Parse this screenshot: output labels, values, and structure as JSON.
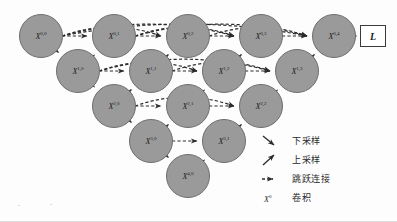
{
  "figure": {
    "node_fill": "#9a9a9a",
    "node_stroke": "#6e6e6e",
    "arrow_color": "#2b2b2b",
    "background": "#fdfdfd"
  },
  "nodes": [
    {
      "id": "x00",
      "label": "X",
      "sup": "0,0",
      "cx": 41,
      "cy": 36,
      "r": 22
    },
    {
      "id": "x01",
      "label": "X",
      "sup": "0,1",
      "cx": 114,
      "cy": 36,
      "r": 22
    },
    {
      "id": "x02",
      "label": "X",
      "sup": "0,2",
      "cx": 188,
      "cy": 36,
      "r": 22
    },
    {
      "id": "x03",
      "label": "X",
      "sup": "0,3",
      "cx": 261,
      "cy": 36,
      "r": 22
    },
    {
      "id": "x04",
      "label": "X",
      "sup": "0,4",
      "cx": 334,
      "cy": 36,
      "r": 22
    },
    {
      "id": "x10",
      "label": "X",
      "sup": "1,0",
      "cx": 78,
      "cy": 71,
      "r": 22
    },
    {
      "id": "x11",
      "label": "X",
      "sup": "1,1",
      "cx": 151,
      "cy": 71,
      "r": 22
    },
    {
      "id": "x12",
      "label": "X",
      "sup": "1,2",
      "cx": 224,
      "cy": 71,
      "r": 22
    },
    {
      "id": "x13",
      "label": "X",
      "sup": "1,3",
      "cx": 297,
      "cy": 71,
      "r": 22
    },
    {
      "id": "x20",
      "label": "X",
      "sup": "2,0",
      "cx": 114,
      "cy": 106,
      "r": 22
    },
    {
      "id": "x21",
      "label": "X",
      "sup": "2,1",
      "cx": 188,
      "cy": 106,
      "r": 22
    },
    {
      "id": "x22",
      "label": "X",
      "sup": "2,2",
      "cx": 261,
      "cy": 106,
      "r": 22
    },
    {
      "id": "x30",
      "label": "X",
      "sup": "3,0",
      "cx": 151,
      "cy": 141,
      "r": 22
    },
    {
      "id": "x31",
      "label": "X",
      "sup": "3,1",
      "cx": 224,
      "cy": 141,
      "r": 22
    },
    {
      "id": "x40",
      "label": "X",
      "sup": "4,0",
      "cx": 188,
      "cy": 176,
      "r": 22
    }
  ],
  "loss": {
    "label": "L",
    "x": 360,
    "y": 25,
    "w": 26,
    "h": 22
  },
  "edges": {
    "down": [
      {
        "from": "x00",
        "to": "x10"
      },
      {
        "from": "x10",
        "to": "x20"
      },
      {
        "from": "x20",
        "to": "x30"
      },
      {
        "from": "x30",
        "to": "x40"
      }
    ],
    "up": [
      {
        "from": "x10",
        "to": "x01"
      },
      {
        "from": "x11",
        "to": "x02"
      },
      {
        "from": "x12",
        "to": "x03"
      },
      {
        "from": "x13",
        "to": "x04"
      },
      {
        "from": "x20",
        "to": "x11"
      },
      {
        "from": "x21",
        "to": "x12"
      },
      {
        "from": "x22",
        "to": "x13"
      },
      {
        "from": "x30",
        "to": "x21"
      },
      {
        "from": "x31",
        "to": "x22"
      },
      {
        "from": "x40",
        "to": "x31"
      }
    ],
    "skip": [
      {
        "from": "x00",
        "to": "x01"
      },
      {
        "from": "x00",
        "to": "x02"
      },
      {
        "from": "x00",
        "to": "x03"
      },
      {
        "from": "x00",
        "to": "x04"
      },
      {
        "from": "x01",
        "to": "x02"
      },
      {
        "from": "x01",
        "to": "x03"
      },
      {
        "from": "x01",
        "to": "x04"
      },
      {
        "from": "x02",
        "to": "x03"
      },
      {
        "from": "x02",
        "to": "x04"
      },
      {
        "from": "x03",
        "to": "x04"
      },
      {
        "from": "x10",
        "to": "x11"
      },
      {
        "from": "x10",
        "to": "x12"
      },
      {
        "from": "x10",
        "to": "x13"
      },
      {
        "from": "x11",
        "to": "x12"
      },
      {
        "from": "x11",
        "to": "x13"
      },
      {
        "from": "x12",
        "to": "x13"
      },
      {
        "from": "x20",
        "to": "x21"
      },
      {
        "from": "x20",
        "to": "x22"
      },
      {
        "from": "x21",
        "to": "x22"
      },
      {
        "from": "x30",
        "to": "x31"
      }
    ],
    "output": [
      {
        "from": "x04",
        "to": "loss"
      }
    ]
  },
  "legend": {
    "items": [
      {
        "glyph": "arrow-down-right-icon",
        "text": "下采样"
      },
      {
        "glyph": "arrow-up-right-icon",
        "text": "上采样"
      },
      {
        "glyph": "dashed-arrow-icon",
        "text": "跳跃连接"
      },
      {
        "glyph": "conv-node-icon",
        "text": "卷积",
        "symbol": "X",
        "symbol_sup": "0"
      }
    ]
  }
}
